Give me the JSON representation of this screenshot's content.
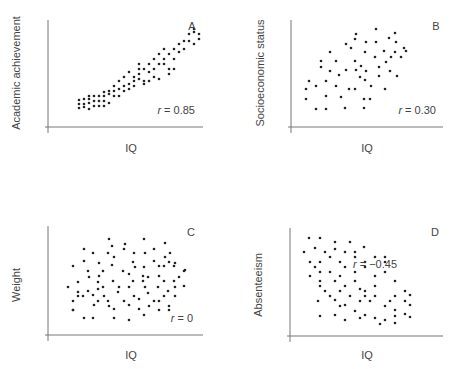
{
  "chart_data": [
    {
      "type": "scatter",
      "panel": "A",
      "xlabel": "IQ",
      "ylabel": "Academic achievement",
      "annotation": "r = 0.85",
      "r": 0.85,
      "axes": {
        "x0": 48,
        "y0": 127,
        "x1": 203,
        "ytop": 20
      },
      "label_pos": {
        "panel": [
          192,
          30
        ],
        "r": [
          195,
          114
        ],
        "xlabel": [
          131,
          152
        ],
        "ylabel": [
          20,
          73
        ]
      },
      "points": [
        [
          79,
          100
        ],
        [
          84,
          99
        ],
        [
          89,
          99
        ],
        [
          79,
          104
        ],
        [
          84,
          104
        ],
        [
          79,
          108
        ],
        [
          89,
          109
        ],
        [
          94,
          106
        ],
        [
          84,
          107
        ],
        [
          99,
          106
        ],
        [
          89,
          103
        ],
        [
          94,
          101
        ],
        [
          89,
          96
        ],
        [
          94,
          96
        ],
        [
          99,
          96
        ],
        [
          104,
          96
        ],
        [
          104,
          101
        ],
        [
          99,
          101
        ],
        [
          104,
          106
        ],
        [
          109,
          103
        ],
        [
          109,
          94
        ],
        [
          104,
          92
        ],
        [
          109,
          91
        ],
        [
          114,
          91
        ],
        [
          114,
          96
        ],
        [
          119,
          89
        ],
        [
          119,
          96
        ],
        [
          114,
          86
        ],
        [
          119,
          81
        ],
        [
          124,
          86
        ],
        [
          124,
          91
        ],
        [
          124,
          77
        ],
        [
          129,
          84
        ],
        [
          129,
          89
        ],
        [
          134,
          81
        ],
        [
          134,
          86
        ],
        [
          129,
          72
        ],
        [
          139,
          69
        ],
        [
          134,
          77
        ],
        [
          139,
          79
        ],
        [
          139,
          74
        ],
        [
          144,
          69
        ],
        [
          144,
          81
        ],
        [
          149,
          64
        ],
        [
          149,
          72
        ],
        [
          144,
          84
        ],
        [
          154,
          59
        ],
        [
          154,
          69
        ],
        [
          154,
          77
        ],
        [
          159,
          64
        ],
        [
          159,
          54
        ],
        [
          164,
          49
        ],
        [
          164,
          59
        ],
        [
          164,
          64
        ],
        [
          169,
          54
        ],
        [
          169,
          69
        ],
        [
          174,
          59
        ],
        [
          174,
          69
        ],
        [
          174,
          49
        ],
        [
          179,
          44
        ],
        [
          179,
          52
        ],
        [
          184,
          41
        ],
        [
          184,
          49
        ],
        [
          189,
          34
        ],
        [
          189,
          41
        ],
        [
          194,
          32
        ],
        [
          194,
          44
        ],
        [
          199,
          39
        ],
        [
          194,
          29
        ],
        [
          199,
          34
        ],
        [
          159,
          79
        ],
        [
          169,
          74
        ],
        [
          139,
          64
        ],
        [
          149,
          81
        ]
      ]
    },
    {
      "type": "scatter",
      "panel": "B",
      "xlabel": "IQ",
      "ylabel": "Socioeconomic status",
      "annotation": "r = 0.30",
      "r": 0.3,
      "axes": {
        "x0": 291,
        "y0": 127,
        "x1": 443,
        "ytop": 20
      },
      "label_pos": {
        "panel": [
          436,
          30
        ],
        "r": [
          436,
          114
        ],
        "xlabel": [
          367,
          152
        ],
        "ylabel": [
          264,
          73
        ]
      },
      "points": [
        [
          306,
          89
        ],
        [
          306,
          99
        ],
        [
          309,
          81
        ],
        [
          316,
          86
        ],
        [
          316,
          109
        ],
        [
          326,
          109
        ],
        [
          326,
          96
        ],
        [
          326,
          81
        ],
        [
          321,
          67
        ],
        [
          321,
          61
        ],
        [
          330,
          71
        ],
        [
          330,
          52
        ],
        [
          336,
          61
        ],
        [
          336,
          86
        ],
        [
          339,
          75
        ],
        [
          341,
          97
        ],
        [
          346,
          44
        ],
        [
          351,
          48
        ],
        [
          346,
          70
        ],
        [
          349,
          89
        ],
        [
          345,
          108
        ],
        [
          356,
          70
        ],
        [
          355,
          89
        ],
        [
          355,
          61
        ],
        [
          360,
          77
        ],
        [
          356,
          34
        ],
        [
          355,
          39
        ],
        [
          361,
          66
        ],
        [
          364,
          99
        ],
        [
          364,
          108
        ],
        [
          366,
          71
        ],
        [
          365,
          80
        ],
        [
          365,
          52
        ],
        [
          366,
          42
        ],
        [
          371,
          86
        ],
        [
          370,
          99
        ],
        [
          375,
          57
        ],
        [
          376,
          42
        ],
        [
          376,
          29
        ],
        [
          379,
          67
        ],
        [
          379,
          76
        ],
        [
          384,
          51
        ],
        [
          385,
          89
        ],
        [
          389,
          38
        ],
        [
          386,
          62
        ],
        [
          390,
          71
        ],
        [
          391,
          57
        ],
        [
          395,
          52
        ],
        [
          395,
          33
        ],
        [
          396,
          42
        ],
        [
          397,
          76
        ],
        [
          401,
          57
        ],
        [
          404,
          48
        ],
        [
          406,
          51
        ]
      ]
    },
    {
      "type": "scatter",
      "panel": "C",
      "xlabel": "IQ",
      "ylabel": "Weight",
      "annotation": "r = 0",
      "r": 0,
      "axes": {
        "x0": 48,
        "y0": 335,
        "x1": 203,
        "ytop": 226
      },
      "label_pos": {
        "panel": [
          191,
          236
        ],
        "r": [
          193,
          322
        ],
        "xlabel": [
          131,
          359
        ],
        "ylabel": [
          20,
          285
        ]
      },
      "points": [
        [
          109,
          239
        ],
        [
          112,
          246
        ],
        [
          125,
          244
        ],
        [
          144,
          239
        ],
        [
          165,
          243
        ],
        [
          84,
          249
        ],
        [
          93,
          253
        ],
        [
          108,
          253
        ],
        [
          114,
          257
        ],
        [
          124,
          249
        ],
        [
          134,
          253
        ],
        [
          145,
          253
        ],
        [
          154,
          249
        ],
        [
          165,
          257
        ],
        [
          170,
          253
        ],
        [
          73,
          266
        ],
        [
          84,
          261
        ],
        [
          99,
          263
        ],
        [
          112,
          265
        ],
        [
          133,
          262
        ],
        [
          144,
          267
        ],
        [
          154,
          261
        ],
        [
          164,
          266
        ],
        [
          169,
          262
        ],
        [
          175,
          263
        ],
        [
          88,
          271
        ],
        [
          103,
          271
        ],
        [
          123,
          271
        ],
        [
          135,
          267
        ],
        [
          159,
          266
        ],
        [
          174,
          266
        ],
        [
          184,
          271
        ],
        [
          89,
          277
        ],
        [
          99,
          276
        ],
        [
          129,
          274
        ],
        [
          143,
          276
        ],
        [
          148,
          277
        ],
        [
          159,
          276
        ],
        [
          179,
          277
        ],
        [
          78,
          282
        ],
        [
          98,
          282
        ],
        [
          113,
          281
        ],
        [
          133,
          281
        ],
        [
          143,
          281
        ],
        [
          164,
          281
        ],
        [
          174,
          281
        ],
        [
          185,
          270
        ],
        [
          68,
          287
        ],
        [
          78,
          292
        ],
        [
          88,
          291
        ],
        [
          98,
          289
        ],
        [
          103,
          287
        ],
        [
          119,
          287
        ],
        [
          129,
          287
        ],
        [
          145,
          287
        ],
        [
          158,
          287
        ],
        [
          175,
          287
        ],
        [
          184,
          286
        ],
        [
          78,
          296
        ],
        [
          93,
          295
        ],
        [
          104,
          296
        ],
        [
          118,
          292
        ],
        [
          134,
          296
        ],
        [
          148,
          293
        ],
        [
          168,
          291
        ],
        [
          175,
          296
        ],
        [
          73,
          301
        ],
        [
          83,
          296
        ],
        [
          98,
          301
        ],
        [
          108,
          301
        ],
        [
          124,
          301
        ],
        [
          139,
          299
        ],
        [
          159,
          301
        ],
        [
          164,
          296
        ],
        [
          73,
          310
        ],
        [
          94,
          305
        ],
        [
          109,
          306
        ],
        [
          114,
          309
        ],
        [
          129,
          305
        ],
        [
          139,
          309
        ],
        [
          149,
          306
        ],
        [
          154,
          301
        ],
        [
          169,
          306
        ],
        [
          73,
          310
        ],
        [
          84,
          318
        ],
        [
          93,
          318
        ],
        [
          114,
          318
        ],
        [
          129,
          320
        ],
        [
          144,
          315
        ],
        [
          159,
          310
        ],
        [
          169,
          310
        ]
      ]
    },
    {
      "type": "scatter",
      "panel": "D",
      "xlabel": "IQ",
      "ylabel": "Absenteeism",
      "annotation": "r = −0.45",
      "r": -0.45,
      "axes": {
        "x0": 290,
        "y0": 336,
        "x1": 443,
        "ytop": 228
      },
      "label_pos": {
        "panel": [
          435,
          236
        ],
        "r": [
          397,
          268
        ],
        "xlabel": [
          367,
          359
        ],
        "ylabel": [
          262,
          285
        ]
      },
      "points": [
        [
          309,
          238
        ],
        [
          320,
          238
        ],
        [
          335,
          242
        ],
        [
          350,
          242
        ],
        [
          304,
          252
        ],
        [
          315,
          248
        ],
        [
          325,
          252
        ],
        [
          335,
          249
        ],
        [
          345,
          252
        ],
        [
          355,
          252
        ],
        [
          364,
          247
        ],
        [
          310,
          262
        ],
        [
          315,
          267
        ],
        [
          320,
          262
        ],
        [
          330,
          257
        ],
        [
          340,
          262
        ],
        [
          345,
          267
        ],
        [
          355,
          257
        ],
        [
          365,
          262
        ],
        [
          375,
          257
        ],
        [
          385,
          257
        ],
        [
          385,
          272
        ],
        [
          310,
          276
        ],
        [
          320,
          272
        ],
        [
          330,
          272
        ],
        [
          340,
          276
        ],
        [
          355,
          272
        ],
        [
          365,
          267
        ],
        [
          375,
          276
        ],
        [
          385,
          262
        ],
        [
          320,
          281
        ],
        [
          320,
          286
        ],
        [
          335,
          281
        ],
        [
          345,
          286
        ],
        [
          355,
          281
        ],
        [
          360,
          289
        ],
        [
          365,
          291
        ],
        [
          375,
          286
        ],
        [
          395,
          281
        ],
        [
          325,
          291
        ],
        [
          330,
          296
        ],
        [
          340,
          291
        ],
        [
          350,
          296
        ],
        [
          365,
          296
        ],
        [
          375,
          296
        ],
        [
          395,
          296
        ],
        [
          405,
          291
        ],
        [
          318,
          301
        ],
        [
          335,
          300
        ],
        [
          345,
          305
        ],
        [
          360,
          301
        ],
        [
          370,
          301
        ],
        [
          390,
          301
        ],
        [
          405,
          301
        ],
        [
          410,
          295
        ],
        [
          320,
          316
        ],
        [
          340,
          306
        ],
        [
          355,
          311
        ],
        [
          365,
          315
        ],
        [
          385,
          306
        ],
        [
          395,
          310
        ],
        [
          410,
          305
        ],
        [
          335,
          315
        ],
        [
          345,
          320
        ],
        [
          375,
          318
        ],
        [
          385,
          320
        ],
        [
          395,
          316
        ],
        [
          405,
          314
        ],
        [
          380,
          324
        ],
        [
          395,
          323
        ],
        [
          410,
          317
        ],
        [
          360,
          318
        ]
      ]
    }
  ]
}
